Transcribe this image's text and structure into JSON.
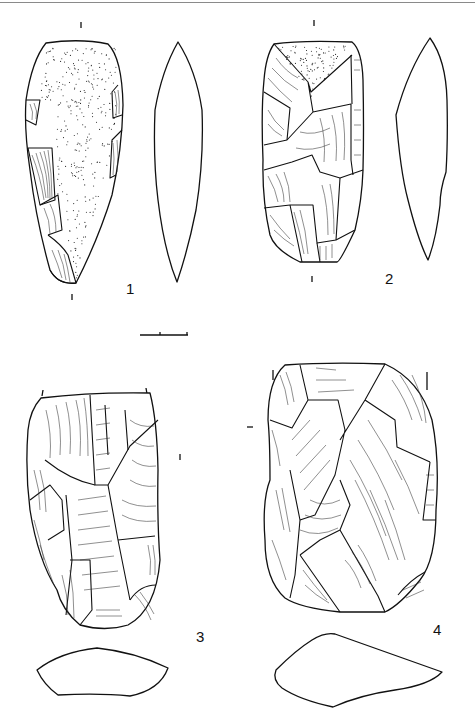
{
  "figure": {
    "type": "archaeological lithic illustration plate",
    "stroke_color": "#111111",
    "background": "#ffffff",
    "scale_bar": {
      "x_start": 140,
      "x_end": 188,
      "y": 335,
      "divisions": 2
    },
    "artifacts": [
      {
        "number": "1",
        "label": "1",
        "views": [
          "dorsal face (cortex stippled, lateral retouch)",
          "side profile (lenticular)"
        ]
      },
      {
        "number": "2",
        "label": "2",
        "views": [
          "dorsal face (flake scars, cortex patch at top)",
          "side profile"
        ]
      },
      {
        "number": "3",
        "label": "3",
        "views": [
          "dorsal face (flake scars)",
          "cross-section"
        ]
      },
      {
        "number": "4",
        "label": "4",
        "views": [
          "dorsal face (flake scars)",
          "cross-section"
        ]
      }
    ]
  }
}
